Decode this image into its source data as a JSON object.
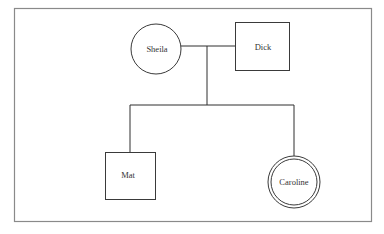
{
  "diagram": {
    "type": "genogram",
    "colors": {
      "frame": "#8a8a8a",
      "stroke": "#3a3a3a",
      "text": "#333333",
      "background": "#ffffff"
    },
    "parents": [
      {
        "name": "Sheila",
        "shape": "circle",
        "role": "mother"
      },
      {
        "name": "Dick",
        "shape": "square",
        "role": "father"
      }
    ],
    "children": [
      {
        "name": "Mat",
        "shape": "square"
      },
      {
        "name": "Caroline",
        "shape": "double-circle"
      }
    ]
  }
}
